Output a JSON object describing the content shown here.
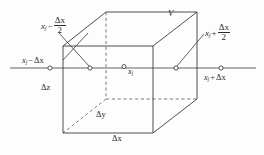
{
  "figure": {
    "stroke_color": "#3a3a3a",
    "text_color": "#2b2b2b",
    "background_color": "#fdfdfd"
  },
  "labels": {
    "volume": "V",
    "center_point": "x",
    "center_point_sub": "j",
    "left_face": {
      "var": "x",
      "sub": "j",
      "operator": "−",
      "numerator": "Δx",
      "denominator": "2"
    },
    "right_face": {
      "var": "x",
      "sub": "j",
      "operator": "+",
      "numerator": "Δx",
      "denominator": "2"
    },
    "left_node": {
      "var": "x",
      "sub": "j",
      "operator": "−",
      "term": "Δx"
    },
    "right_node": {
      "var": "x",
      "sub": "j",
      "operator": "+",
      "term": "Δx"
    },
    "depth_z": "Δz",
    "depth_y": "Δy",
    "width_x": "Δx"
  },
  "markers": [
    {
      "name": "node-x-minus-delta",
      "x": 50,
      "y": 68
    },
    {
      "name": "face-left-center",
      "x": 90,
      "y": 68
    },
    {
      "name": "cell-center",
      "x": 124,
      "y": 67
    },
    {
      "name": "face-right-center",
      "x": 176,
      "y": 68
    },
    {
      "name": "node-x-plus-delta",
      "x": 221,
      "y": 68
    }
  ]
}
